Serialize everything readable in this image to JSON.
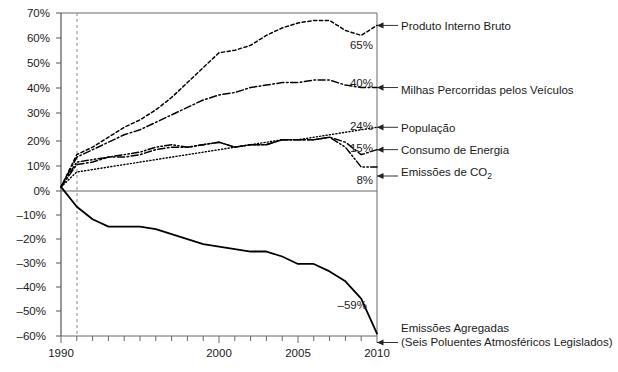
{
  "chart_data": {
    "type": "line",
    "title": "",
    "xlabel": "",
    "ylabel": "",
    "xlim": [
      1990,
      2010
    ],
    "ylim": [
      -60,
      70
    ],
    "grid": false,
    "legend_position": "right-annotations",
    "ytick_labels": [
      "70%",
      "60%",
      "50%",
      "40%",
      "30%",
      "20%",
      "10%",
      "0%",
      "–10%",
      "–20%",
      "–30%",
      "–40%",
      "–50%",
      "–60%"
    ],
    "ytick_values": [
      70,
      60,
      50,
      40,
      30,
      20,
      10,
      0,
      -10,
      -20,
      -30,
      -40,
      -50,
      -60
    ],
    "xtick_labels": [
      "1990",
      "2000",
      "2005",
      "2010"
    ],
    "xtick_values": [
      1990,
      2000,
      2005,
      2010
    ],
    "xtick_minor_values": [
      1991,
      1992,
      1993,
      1994,
      1995,
      1996,
      1997,
      1998,
      1999,
      2001,
      2002,
      2003,
      2004,
      2006,
      2007,
      2008,
      2009
    ],
    "reference_line": {
      "x": 1991,
      "style": "dashed",
      "color": "#888888"
    },
    "x": [
      1990,
      1991,
      1992,
      1993,
      1994,
      1995,
      1996,
      1997,
      1998,
      1999,
      2000,
      2001,
      2002,
      2003,
      2004,
      2005,
      2006,
      2007,
      2008,
      2009,
      2010
    ],
    "series": [
      {
        "name": "Produto Interno Bruto",
        "line_style": "dotted",
        "end_value_label": "65%",
        "values": [
          0,
          13,
          16,
          20,
          24,
          27,
          31,
          36,
          42,
          48,
          54,
          55,
          57,
          61,
          64,
          66,
          67,
          67,
          63,
          61,
          65
        ]
      },
      {
        "name": "Milhas Percorridas pelos Veículos",
        "line_style": "dash-dot",
        "end_value_label": "40%",
        "values": [
          0,
          12,
          15,
          18,
          21,
          23,
          26,
          29,
          32,
          35,
          37,
          38,
          40,
          41,
          42,
          42,
          43,
          43,
          41,
          40,
          40
        ]
      },
      {
        "name": "População",
        "line_style": "fine-dotted",
        "end_value_label": "24%",
        "values": [
          0,
          6,
          7,
          8,
          9,
          10,
          11,
          12,
          13,
          14,
          15,
          16,
          17,
          18,
          19,
          19,
          20,
          21,
          22,
          23,
          24
        ]
      },
      {
        "name": "Consumo de Energia",
        "line_style": "dash-dot",
        "end_value_label": "15%",
        "values": [
          0,
          9,
          10,
          12,
          12,
          13,
          15,
          16,
          16,
          17,
          18,
          16,
          17,
          17,
          19,
          19,
          19,
          20,
          18,
          13,
          15
        ]
      },
      {
        "name": "Emissões de CO2",
        "label_main": "Emissões de CO",
        "label_sub": "2",
        "line_style": "dash-dot-dot",
        "end_value_label": "8%",
        "values": [
          0,
          10,
          11,
          12,
          13,
          14,
          16,
          17,
          16,
          17,
          18,
          16,
          17,
          17,
          19,
          19,
          19,
          20,
          16,
          8,
          8
        ]
      },
      {
        "name": "Emissões Agregadas (Seis Poluentes Atmosféricos Legislados)",
        "label_line1": "Emissões Agregadas",
        "label_line2": "(Seis Poluentes Atmosféricos Legislados)",
        "line_style": "solid",
        "end_value_label": "–59%",
        "values": [
          0,
          -8,
          -13,
          -16,
          -16,
          -16,
          -17,
          -19,
          -21,
          -23,
          -24,
          -25,
          -26,
          -26,
          -28,
          -31,
          -31,
          -34,
          -38,
          -45,
          -59
        ]
      }
    ],
    "annotations": [
      {
        "text": "Produto Interno Bruto",
        "at_value": 65
      },
      {
        "text": "Milhas Percorridas pelos Veículos",
        "at_value": 40
      },
      {
        "text": "População",
        "at_value": 24
      },
      {
        "text": "Consumo de Energia",
        "at_value": 15
      },
      {
        "text": "Emissões de CO2",
        "at_value": 8
      },
      {
        "text": "Emissões Agregadas (Seis Poluentes Atmosféricos Legislados)",
        "at_value": -59
      }
    ],
    "colors": {
      "line": "#000000",
      "axis": "#555555",
      "reference": "#8a8a8a",
      "text": "#1a1a1a"
    }
  }
}
